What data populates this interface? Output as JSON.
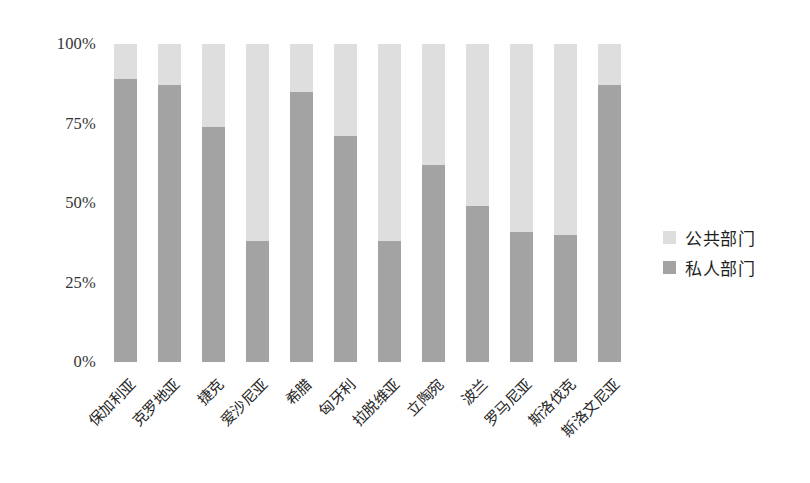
{
  "chart_data": {
    "type": "bar",
    "stacked": true,
    "stack_total": 100,
    "title": "",
    "subtitle": "",
    "xlabel": "",
    "ylabel": "",
    "ylim": [
      0,
      100
    ],
    "ytick_labels": [
      "0%",
      "25%",
      "50%",
      "75%",
      "100%"
    ],
    "ytick_values": [
      0,
      25,
      50,
      75,
      100
    ],
    "grid": false,
    "legend_position": "right",
    "categories": [
      "保加利亚",
      "克罗地亚",
      "捷克",
      "爱沙尼亚",
      "希腊",
      "匈牙利",
      "拉脱维亚",
      "立陶宛",
      "波兰",
      "罗马尼亚",
      "斯洛伐克",
      "斯洛文尼亚"
    ],
    "series": [
      {
        "name": "私人部门",
        "color": "#a3a3a3",
        "values": [
          89,
          87,
          74,
          38,
          85,
          71,
          38,
          62,
          49,
          41,
          40,
          87
        ]
      },
      {
        "name": "公共部门",
        "color": "#dedede",
        "values": [
          11,
          13,
          26,
          62,
          15,
          29,
          62,
          38,
          51,
          59,
          60,
          13
        ]
      }
    ]
  },
  "legend": {
    "items": [
      {
        "label": "公共部门",
        "color": "#dedede"
      },
      {
        "label": "私人部门",
        "color": "#a3a3a3"
      }
    ]
  }
}
